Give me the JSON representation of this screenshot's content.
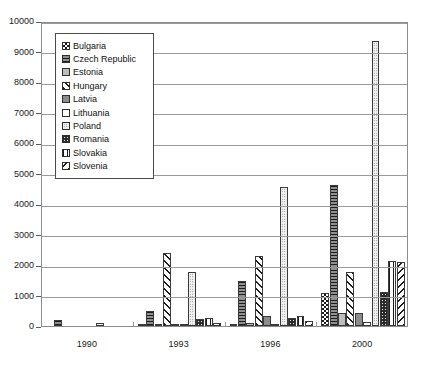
{
  "chart_data": {
    "type": "bar",
    "title": "",
    "subtitle": "",
    "xlabel": "",
    "ylabel": "",
    "categories": [
      "1990",
      "1993",
      "1996",
      "2000"
    ],
    "ylim": [
      0,
      10000
    ],
    "yticks": [
      0,
      1000,
      2000,
      3000,
      4000,
      5000,
      6000,
      7000,
      8000,
      9000,
      10000
    ],
    "ytick_labels": [
      "0",
      "1000",
      "2000",
      "3000",
      "4000",
      "5000",
      "6000",
      "7000",
      "8000",
      "9000",
      "10000"
    ],
    "grid": true,
    "legend_position": "upper-left-inside",
    "series": [
      {
        "name": "Bulgaria",
        "fill": "checkerboard",
        "values": [
          0,
          20,
          60,
          1080
        ]
      },
      {
        "name": "Czech Republic",
        "fill": "horizontal-lines",
        "values": [
          210,
          490,
          1460,
          4620
        ]
      },
      {
        "name": "Estonia",
        "fill": "light-gray-solid",
        "values": [
          0,
          70,
          105,
          420
        ]
      },
      {
        "name": "Hungary",
        "fill": "diagonal-hatch",
        "values": [
          0,
          2390,
          2290,
          1760
        ]
      },
      {
        "name": "Latvia",
        "fill": "gray-solid",
        "values": [
          0,
          60,
          330,
          420
        ]
      },
      {
        "name": "Lithuania",
        "fill": "white-solid",
        "values": [
          0,
          45,
          55,
          140
        ]
      },
      {
        "name": "Poland",
        "fill": "fine-dots",
        "values": [
          95,
          1760,
          4550,
          9350
        ]
      },
      {
        "name": "Romania",
        "fill": "dark-dots",
        "values": [
          0,
          215,
          250,
          1100
        ]
      },
      {
        "name": "Slovakia",
        "fill": "vertical-lines",
        "values": [
          0,
          260,
          330,
          2130
        ]
      },
      {
        "name": "Slovenia",
        "fill": "reverse-hatch",
        "values": [
          0,
          110,
          155,
          2090
        ]
      }
    ]
  },
  "legend": {
    "items": [
      {
        "label": "Bulgaria"
      },
      {
        "label": "Czech Republic"
      },
      {
        "label": "Estonia"
      },
      {
        "label": "Hungary"
      },
      {
        "label": "Latvia"
      },
      {
        "label": "Lithuania"
      },
      {
        "label": "Poland"
      },
      {
        "label": "Romania"
      },
      {
        "label": "Slovakia"
      },
      {
        "label": "Slovenia"
      }
    ]
  }
}
